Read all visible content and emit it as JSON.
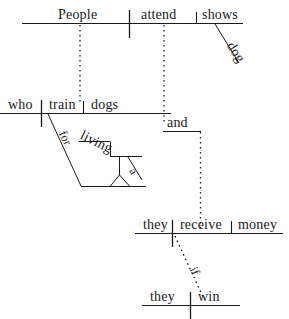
{
  "diagram": {
    "type": "reed-kellogg-sentence-diagram",
    "sentence": "People who train dogs for a living attend dog shows and they receive money if they win.",
    "ink_color": "#1a1a1a",
    "background_color": "#fefefe",
    "clauses": [
      {
        "id": "main-clause-1",
        "subject": "People",
        "verb": "attend",
        "direct_object": "shows",
        "modifiers": [
          {
            "word": "dog",
            "attaches_to": "shows",
            "line": "diagonal"
          }
        ]
      },
      {
        "id": "relative-clause",
        "subject": "who",
        "verb": "train",
        "direct_object": "dogs",
        "modifiers": [
          {
            "word": "for",
            "attaches_to": "train",
            "line": "diagonal-preposition"
          },
          {
            "word": "living",
            "attaches_to": "for",
            "line": "gerund-stand"
          },
          {
            "word": "a",
            "attaches_to": "living",
            "line": "diagonal"
          }
        ]
      },
      {
        "id": "main-clause-2",
        "subject": "they",
        "verb": "receive",
        "direct_object": "money"
      },
      {
        "id": "subordinate-clause",
        "subject": "they",
        "verb": "win",
        "subordinator": "if"
      }
    ],
    "conjunction": {
      "word": "and",
      "joins": [
        "main-clause-1",
        "main-clause-2"
      ],
      "line": "dotted-bracket"
    }
  },
  "labels": {
    "people": "People",
    "attend": "attend",
    "shows": "shows",
    "dog": "dog",
    "who": "who",
    "train": "train",
    "dogs": "dogs",
    "for": "for",
    "living": "living",
    "a": "a",
    "and": "and",
    "they1": "they",
    "receive": "receive",
    "money": "money",
    "if": "if",
    "they2": "they",
    "win": "win"
  }
}
